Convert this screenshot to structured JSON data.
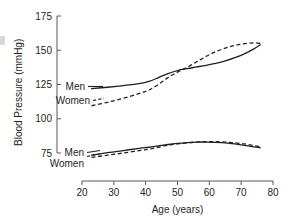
{
  "chart_data": {
    "type": "line",
    "title": "",
    "xlabel": "Age (years)",
    "ylabel": "Blood Pressure (mmHg)",
    "xlim": [
      20,
      80
    ],
    "ylim": [
      75,
      175
    ],
    "xticks": [
      20,
      30,
      40,
      50,
      60,
      70,
      80
    ],
    "yticks": [
      75,
      100,
      125,
      150,
      175
    ],
    "grid": false,
    "legend_position": "inline-left",
    "annotations": [
      {
        "text": "Men",
        "series": "systolic-men",
        "style": "solid"
      },
      {
        "text": "Women",
        "series": "systolic-women",
        "style": "dashed"
      },
      {
        "text": "Men",
        "series": "diastolic-men",
        "style": "solid"
      },
      {
        "text": "Women",
        "series": "diastolic-women",
        "style": "dashed"
      }
    ],
    "series": [
      {
        "name": "Systolic Men",
        "style": "solid",
        "x": [
          23,
          28,
          33,
          38,
          41,
          44,
          47,
          50,
          53,
          56,
          59,
          62,
          65,
          68,
          71,
          74,
          76
        ],
        "values": [
          122.0,
          123.0,
          124.2,
          125.6,
          127.2,
          130.0,
          133.0,
          135.2,
          136.6,
          137.8,
          139.0,
          140.4,
          142.2,
          144.6,
          147.4,
          151.0,
          154.0
        ]
      },
      {
        "name": "Systolic Women",
        "style": "dashed",
        "x": [
          23,
          28,
          33,
          38,
          41,
          44,
          47,
          50,
          53,
          56,
          59,
          62,
          65,
          68,
          71,
          74,
          76
        ],
        "values": [
          109.5,
          112.0,
          115.0,
          118.5,
          121.0,
          125.0,
          130.0,
          134.0,
          137.5,
          141.5,
          145.5,
          149.0,
          151.5,
          153.5,
          154.8,
          155.4,
          155.0
        ]
      },
      {
        "name": "Diastolic Men",
        "style": "solid",
        "x": [
          23,
          28,
          33,
          38,
          41,
          44,
          47,
          50,
          53,
          56,
          59,
          62,
          65,
          68,
          71,
          74,
          76
        ],
        "values": [
          73.5,
          75.2,
          76.8,
          78.4,
          79.2,
          80.2,
          81.2,
          82.0,
          82.6,
          83.0,
          83.0,
          82.8,
          82.4,
          81.6,
          80.6,
          79.4,
          78.8
        ]
      },
      {
        "name": "Diastolic Women",
        "style": "dashed",
        "x": [
          23,
          28,
          33,
          38,
          41,
          44,
          47,
          50,
          53,
          56,
          59,
          62,
          65,
          68,
          71,
          74,
          76
        ],
        "values": [
          71.8,
          73.4,
          75.0,
          76.8,
          77.8,
          79.2,
          80.6,
          81.6,
          82.4,
          83.0,
          83.2,
          83.2,
          83.0,
          82.4,
          81.6,
          80.4,
          79.6
        ]
      }
    ]
  },
  "axes": {
    "y_title": "Blood Pressure (mmHg)",
    "x_title": "Age (years)",
    "y_tick_labels": [
      "175",
      "150",
      "125",
      "100",
      "75"
    ],
    "x_tick_labels": [
      "20",
      "30",
      "40",
      "50",
      "60",
      "70",
      "80"
    ]
  },
  "labels": {
    "systolic_men": "Men",
    "systolic_women": "Women",
    "diastolic_men": "Men",
    "diastolic_women": "Women"
  }
}
